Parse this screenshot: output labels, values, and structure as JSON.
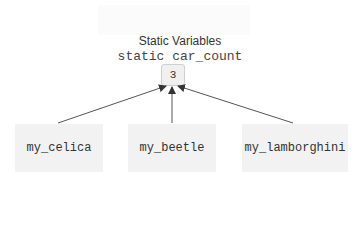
{
  "diagram": {
    "title": "Static Variables",
    "static_variable": {
      "name": "static car_count",
      "value": "3"
    },
    "objects": [
      {
        "label": "my_celica"
      },
      {
        "label": "my_beetle"
      },
      {
        "label": "my_lamborghini"
      }
    ],
    "edges": [
      {
        "from": "my_celica",
        "to": "car_count"
      },
      {
        "from": "my_beetle",
        "to": "car_count"
      },
      {
        "from": "my_lamborghini",
        "to": "car_count"
      }
    ]
  }
}
